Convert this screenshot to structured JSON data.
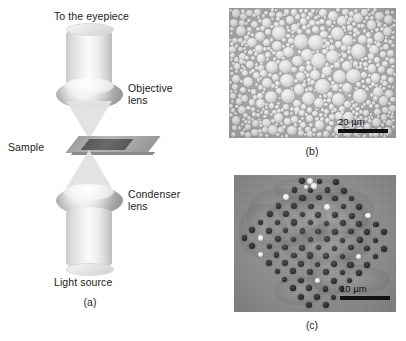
{
  "figure": {
    "background_color": "#ffffff",
    "text_color": "#1b1b1b"
  },
  "panel_a": {
    "tag": "(a)",
    "type": "schematic-diagram",
    "title_label": "To the eyepiece",
    "labels": {
      "eyepiece": "To the eyepiece",
      "objective_lens_line1": "Objective",
      "objective_lens_line2": "lens",
      "sample": "Sample",
      "condenser_lens_line1": "Condenser",
      "condenser_lens_line2": "lens",
      "light_source": "Light source"
    },
    "components": [
      "upper-tube",
      "objective-lens",
      "upper-light-cone",
      "sample-slide",
      "lower-light-cone",
      "condenser-lens",
      "lower-tube"
    ],
    "colors": {
      "tube": "#ededed",
      "lens_rim": "#a3a3a3",
      "slide": "#a8a8a8",
      "slide_inner": "#5e5e5e",
      "cone": "#e2e2e2"
    }
  },
  "panel_b": {
    "tag": "(b)",
    "type": "micrograph",
    "description": "densely packed polydisperse bright droplets",
    "scale_bar": {
      "label": "20 µm",
      "value": 20,
      "unit": "µm",
      "bar_color": "#111111"
    },
    "background_color": "#a9a9a9"
  },
  "panel_c": {
    "tag": "(c)",
    "type": "micrograph",
    "description": "rotated square lattice array of dark spots",
    "scale_bar": {
      "label": "10 µm",
      "value": 10,
      "unit": "µm",
      "bar_color": "#111111"
    },
    "background_color": "#8d8d8d"
  }
}
